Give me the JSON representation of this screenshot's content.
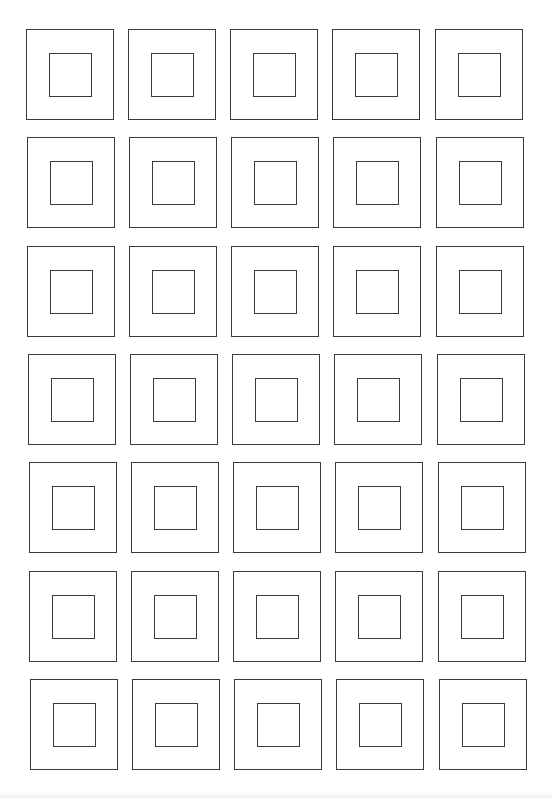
{
  "page": {
    "background": "#ffffff",
    "line_color": "#3a3a3a"
  },
  "grid": {
    "rows": 7,
    "columns": 5,
    "outer_size": {
      "width": 88,
      "height": 91
    },
    "inner_size": {
      "width": 43,
      "height": 44
    },
    "row_tops": [
      29,
      137,
      246,
      354,
      462,
      571,
      679
    ],
    "row_x_shift": [
      0,
      1,
      1,
      2,
      3,
      3,
      4
    ],
    "column_lefts": [
      26,
      128,
      230,
      332,
      435
    ],
    "cells": [
      [
        {
          "label": ""
        },
        {
          "label": ""
        },
        {
          "label": ""
        },
        {
          "label": ""
        },
        {
          "label": ""
        }
      ],
      [
        {
          "label": ""
        },
        {
          "label": ""
        },
        {
          "label": ""
        },
        {
          "label": ""
        },
        {
          "label": ""
        }
      ],
      [
        {
          "label": ""
        },
        {
          "label": ""
        },
        {
          "label": ""
        },
        {
          "label": ""
        },
        {
          "label": ""
        }
      ],
      [
        {
          "label": ""
        },
        {
          "label": ""
        },
        {
          "label": ""
        },
        {
          "label": ""
        },
        {
          "label": ""
        }
      ],
      [
        {
          "label": ""
        },
        {
          "label": ""
        },
        {
          "label": ""
        },
        {
          "label": ""
        },
        {
          "label": ""
        }
      ],
      [
        {
          "label": ""
        },
        {
          "label": ""
        },
        {
          "label": ""
        },
        {
          "label": ""
        },
        {
          "label": ""
        }
      ],
      [
        {
          "label": ""
        },
        {
          "label": ""
        },
        {
          "label": ""
        },
        {
          "label": ""
        },
        {
          "label": ""
        }
      ]
    ]
  }
}
